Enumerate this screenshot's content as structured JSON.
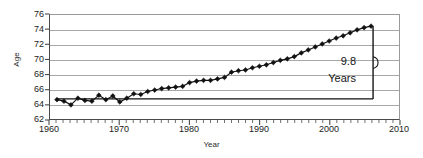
{
  "chart_data": {
    "type": "line",
    "title": "",
    "xlabel": "Year",
    "ylabel": "Age",
    "xlim": [
      1960,
      2010
    ],
    "ylim": [
      62,
      76
    ],
    "ytick_step": 2,
    "xtick_step": 10,
    "xminor_step": 1,
    "grid": true,
    "legend": null,
    "marker": "diamond",
    "series_name": "Age",
    "xticks": [
      "1960",
      "1970",
      "1980",
      "1990",
      "2000",
      "2010"
    ],
    "yticks": [
      "62",
      "64",
      "66",
      "68",
      "70",
      "72",
      "74",
      "76"
    ],
    "x": [
      1961,
      1962,
      1963,
      1964,
      1965,
      1966,
      1967,
      1968,
      1969,
      1970,
      1971,
      1972,
      1973,
      1974,
      1975,
      1976,
      1977,
      1978,
      1979,
      1980,
      1981,
      1982,
      1983,
      1984,
      1985,
      1986,
      1987,
      1988,
      1989,
      1990,
      1991,
      1992,
      1993,
      1994,
      1995,
      1996,
      1997,
      1998,
      1999,
      2000,
      2001,
      2002,
      2003,
      2004,
      2005,
      2006
    ],
    "values": [
      64.6,
      64.4,
      63.9,
      64.8,
      64.5,
      64.4,
      65.2,
      64.6,
      65.1,
      64.3,
      64.8,
      65.4,
      65.3,
      65.7,
      65.9,
      66.1,
      66.2,
      66.3,
      66.4,
      66.9,
      67.1,
      67.2,
      67.2,
      67.4,
      67.6,
      68.3,
      68.5,
      68.6,
      68.9,
      69.1,
      69.3,
      69.6,
      69.9,
      70.1,
      70.4,
      70.9,
      71.3,
      71.7,
      72.1,
      72.5,
      72.9,
      73.2,
      73.6,
      74.0,
      74.3,
      74.5
    ],
    "annotation": {
      "value": "9.8",
      "unit": "Years",
      "baseline_value": 64.7,
      "top_value": 74.5,
      "at_x": 2006
    },
    "baseline_series": {
      "name": "baseline",
      "value": 64.7,
      "from_x": 1961,
      "to_x": 2006
    }
  },
  "colors": {
    "marker": "#111111",
    "line": "#111111",
    "grid": "#a8a8a8",
    "axis": "#4a4a4a",
    "text": "#1b1b1b",
    "annotation": "#151515"
  }
}
